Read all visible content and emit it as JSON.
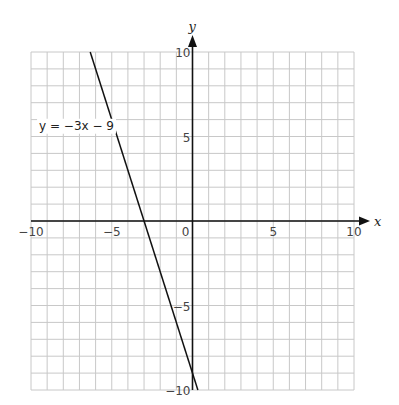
{
  "chart_data": {
    "type": "line",
    "title": "",
    "xlabel": "x",
    "ylabel": "y",
    "xlim": [
      -10,
      10
    ],
    "ylim": [
      -10,
      10
    ],
    "grid": true,
    "grid_step": 1,
    "x_ticks": [
      -10,
      -5,
      0,
      5,
      10
    ],
    "y_ticks": [
      -10,
      -5,
      5,
      10
    ],
    "x_tick_labels": [
      "−10",
      "−5",
      "0",
      "5",
      "10"
    ],
    "y_tick_labels": [
      "−10",
      "−5",
      "5",
      "10"
    ],
    "series": [
      {
        "name": "y = −3x − 9",
        "equation": {
          "slope": -3,
          "intercept": -9
        },
        "x": [
          -6.333,
          0.333
        ],
        "y": [
          10,
          -10
        ],
        "color": "#111111"
      }
    ],
    "annotations": [
      {
        "text": "y = −3x − 9",
        "x": -9.5,
        "y": 5.4
      }
    ],
    "legend": "none"
  },
  "colors": {
    "grid": "#c8c8c8",
    "axis": "#111111",
    "line": "#111111",
    "background": "#ffffff"
  }
}
